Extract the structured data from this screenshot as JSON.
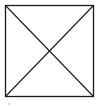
{
  "diagram": {
    "shape": "square-with-diagonals",
    "stroke_color": "#1a1a1a",
    "background": "#ffffff",
    "square": {
      "x1": 5.5,
      "y1": 5.5,
      "x2": 93.5,
      "y2": 96.5
    },
    "diagonals": [
      {
        "from": "top-left",
        "to": "bottom-right"
      },
      {
        "from": "bottom-left",
        "to": "top-right"
      }
    ],
    "marks": [
      {
        "x": 9,
        "y": 104,
        "r": 0.7
      }
    ]
  }
}
